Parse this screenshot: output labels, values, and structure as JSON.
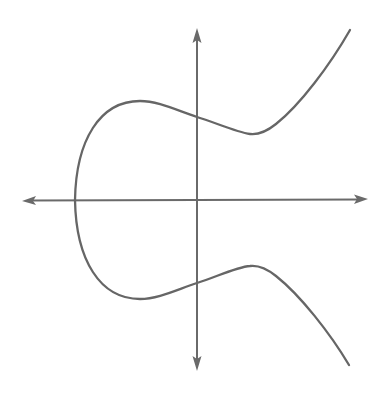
{
  "figure": {
    "description": "Elliptic curve y^2 = x^3 + ax + b plotted over x and y axes with arrowheads; one connected component crossing the x-axis once on the left",
    "colors": {
      "background": "#ffffff",
      "axis": "#6a6a6a",
      "curve": "#666666"
    },
    "axes": {
      "x_axis": {
        "from": [
          22,
          200
        ],
        "to": [
          368,
          200
        ],
        "arrows": "both"
      },
      "y_axis": {
        "from": [
          197,
          28
        ],
        "to": [
          197,
          370
        ],
        "arrows": "both"
      },
      "labels": "none",
      "ticks": "none"
    },
    "curve": {
      "type": "elliptic-curve",
      "symmetric_about": "x-axis",
      "key_points_px": {
        "x_axis_root": [
          75,
          200
        ],
        "upper_local_max": [
          140,
          101
        ],
        "upper_y_intercept": [
          197,
          117
        ],
        "upper_local_min": [
          252,
          134
        ],
        "upper_end": [
          350,
          30
        ],
        "lower_local_min": [
          140,
          299
        ],
        "lower_y_intercept": [
          197,
          283
        ],
        "lower_local_max": [
          252,
          266
        ],
        "lower_end": [
          349,
          365
        ]
      }
    }
  }
}
